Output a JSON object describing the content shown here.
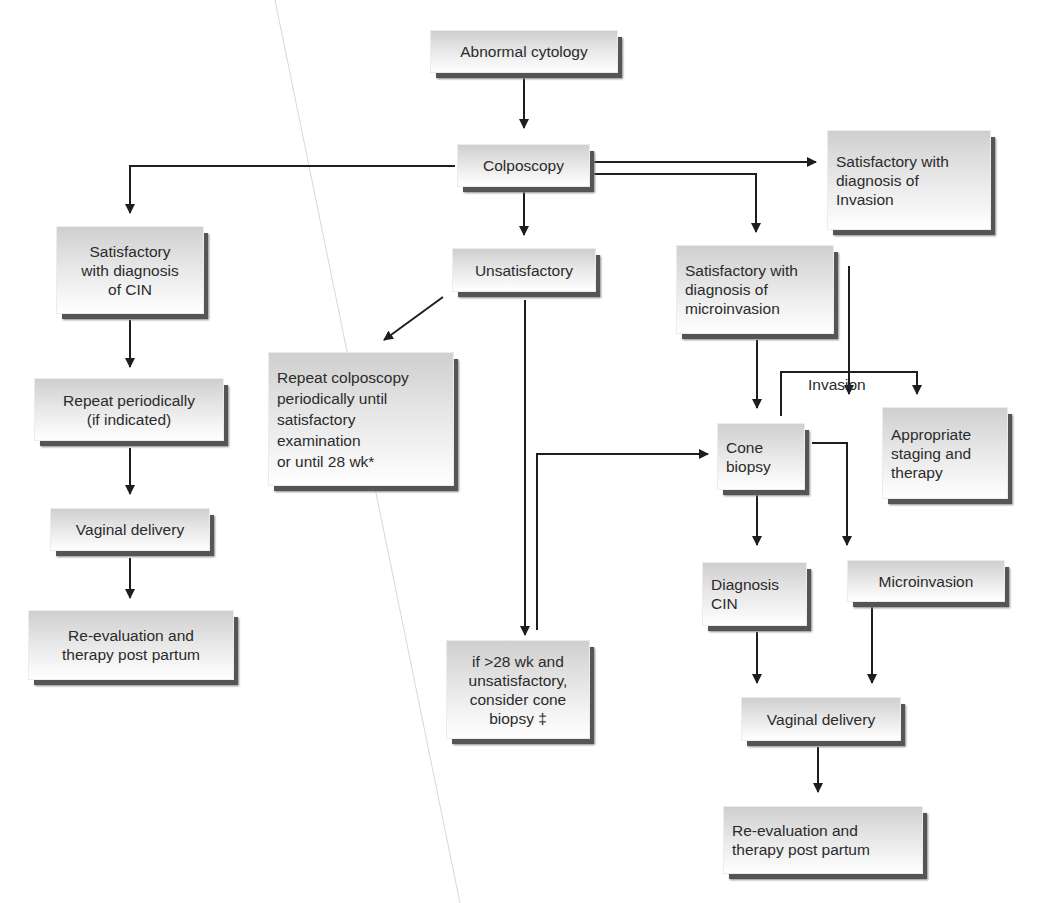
{
  "diagram": {
    "nodes": {
      "abnormal_cytology": "Abnormal cytology",
      "colposcopy": "Colposcopy",
      "sat_invasion": "Satisfactory with\ndiagnosis of\nInvasion",
      "sat_cin": "Satisfactory\nwith diagnosis\nof CIN",
      "unsatisfactory": "Unsatisfactory",
      "sat_microinvasion": "Satisfactory with\ndiagnosis of\nmicroinvasion",
      "repeat_periodically": "Repeat periodically\n(if indicated)",
      "repeat_colposcopy": "Repeat colposcopy\nperiodically until\nsatisfactory\nexamination\nor until 28 wk*",
      "cone_biopsy": "Cone\nbiopsy",
      "staging_therapy": "Appropriate\nstaging and\ntherapy",
      "vaginal_delivery_left": "Vaginal delivery",
      "diagnosis_cin": "Diagnosis\nCIN",
      "microinvasion": "Microinvasion",
      "reeval_left": "Re-evaluation and\ntherapy post partum",
      "over28": "if >28 wk and\nunsatisfactory,\nconsider cone\nbiopsy ‡",
      "vaginal_delivery_right": "Vaginal delivery",
      "reeval_right": "Re-evaluation and\ntherapy post partum"
    },
    "edge_labels": {
      "invasion": "Invasion"
    },
    "colors": {
      "line": "#1e1e1e",
      "box_top": "#cfcfcf",
      "box_bottom": "#ffffff",
      "shadow": "#555555"
    }
  }
}
